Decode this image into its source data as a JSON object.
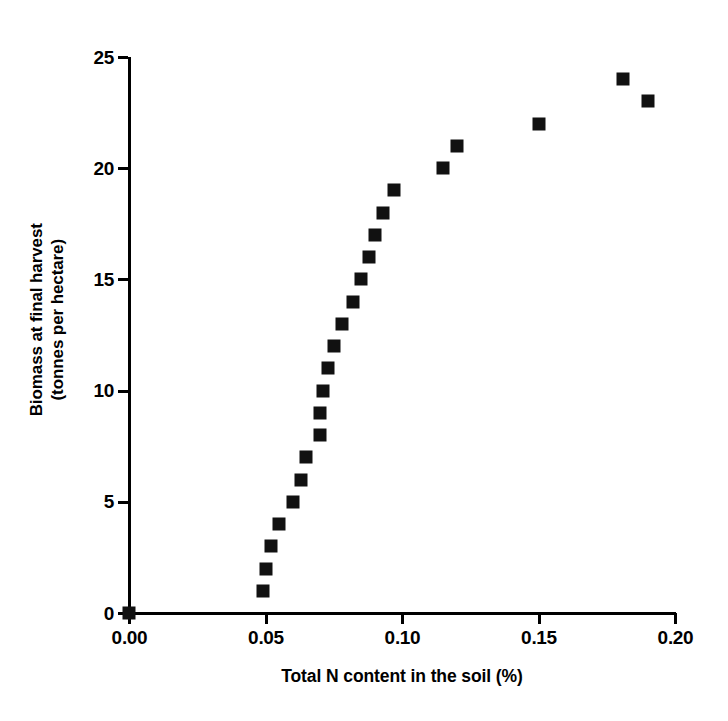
{
  "chart_data": {
    "type": "scatter",
    "title": "",
    "xlabel": "Total N content in the soil (%)",
    "ylabel_line1": "Biomass at final harvest",
    "ylabel_line2": "(tonnes per hectare)",
    "xlim": [
      0.0,
      0.2
    ],
    "ylim": [
      0,
      25
    ],
    "grid": false,
    "legend": "none",
    "marker": "filled-square",
    "marker_color": "#111111",
    "xticks": [
      0.0,
      0.05,
      0.1,
      0.15,
      0.2
    ],
    "xtick_labels": [
      "0.00",
      "0.05",
      "0.10",
      "0.15",
      "0.20"
    ],
    "yticks": [
      0,
      5,
      10,
      15,
      20,
      25
    ],
    "ytick_labels": [
      "0",
      "5",
      "10",
      "15",
      "20",
      "25"
    ],
    "series": [
      {
        "name": "Biomass vs soil N",
        "points": [
          {
            "x": 0.0,
            "y": 0
          },
          {
            "x": 0.049,
            "y": 1
          },
          {
            "x": 0.05,
            "y": 2
          },
          {
            "x": 0.052,
            "y": 3
          },
          {
            "x": 0.055,
            "y": 4
          },
          {
            "x": 0.06,
            "y": 5
          },
          {
            "x": 0.063,
            "y": 6
          },
          {
            "x": 0.065,
            "y": 7
          },
          {
            "x": 0.07,
            "y": 8
          },
          {
            "x": 0.07,
            "y": 9
          },
          {
            "x": 0.071,
            "y": 10
          },
          {
            "x": 0.073,
            "y": 11
          },
          {
            "x": 0.075,
            "y": 12
          },
          {
            "x": 0.078,
            "y": 13
          },
          {
            "x": 0.082,
            "y": 14
          },
          {
            "x": 0.085,
            "y": 15
          },
          {
            "x": 0.088,
            "y": 16
          },
          {
            "x": 0.09,
            "y": 17
          },
          {
            "x": 0.093,
            "y": 18
          },
          {
            "x": 0.097,
            "y": 19
          },
          {
            "x": 0.115,
            "y": 20
          },
          {
            "x": 0.12,
            "y": 21
          },
          {
            "x": 0.15,
            "y": 22
          },
          {
            "x": 0.19,
            "y": 23
          },
          {
            "x": 0.181,
            "y": 24
          }
        ]
      }
    ]
  }
}
